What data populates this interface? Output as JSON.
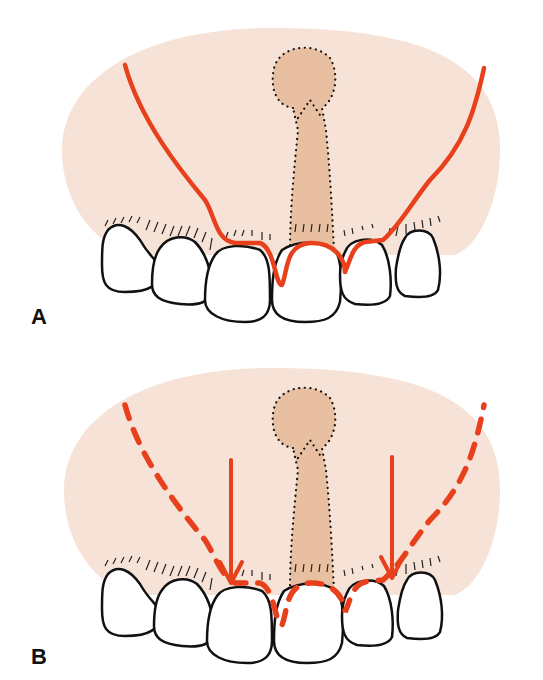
{
  "figure": {
    "panels": [
      {
        "label": "A",
        "description": "Incision outline: solid red line running from upper lateral vestibule, tracing gingival margins around central incisors, with frenum (dotted outline) in midline"
      },
      {
        "label": "B",
        "description": "Dashed red incision lines with vertical red arrows indicating coronal advancement of flap toward gingival margins; frenum outlined by dots in midline"
      }
    ],
    "colors": {
      "mucosa": "#f6e2d6",
      "frenum": "#e8bfa0",
      "incision": "#e8401c",
      "outline": "#111111",
      "tooth": "#ffffff"
    }
  }
}
